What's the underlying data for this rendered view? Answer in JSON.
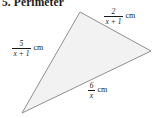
{
  "exercise": {
    "number": "5.",
    "title": "Perimeter"
  },
  "figure": {
    "shape_name": "triangle",
    "fill_color": "#f2f2f2",
    "stroke_color": "#8f8f8f",
    "background_color": "#ffffff",
    "vertices": [
      {
        "name": "top",
        "x": 80,
        "y": 12
      },
      {
        "name": "right",
        "x": 151,
        "y": 51
      },
      {
        "name": "bottom-left",
        "x": 22,
        "y": 113
      }
    ],
    "sides": [
      {
        "id": "top-right-side",
        "position": "top-right",
        "numerator": "2",
        "denominator": "x + 1",
        "unit": "cm",
        "expression": "2/(x + 1) cm"
      },
      {
        "id": "left-side",
        "position": "left",
        "numerator": "5",
        "denominator": "x + 1",
        "unit": "cm",
        "expression": "5/(x + 1) cm"
      },
      {
        "id": "bottom-side",
        "position": "bottom",
        "numerator": "6",
        "denominator": "x",
        "unit": "cm",
        "expression": "6/x cm"
      }
    ]
  }
}
